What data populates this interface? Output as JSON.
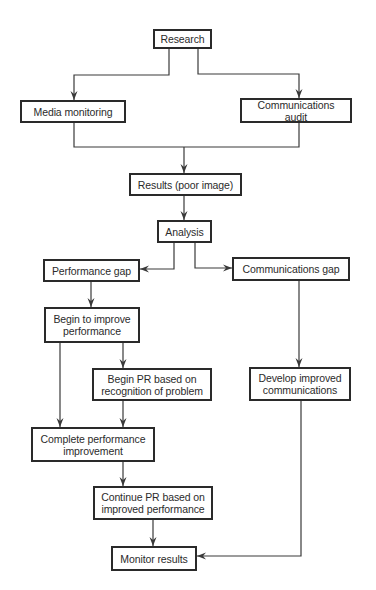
{
  "diagram": {
    "type": "flowchart",
    "line_color": "#3a3a3a",
    "nodes": [
      {
        "id": "research",
        "label": "Research",
        "x": 153,
        "y": 29,
        "w": 59,
        "h": 20
      },
      {
        "id": "media-monitoring",
        "label": "Media monitoring",
        "x": 20,
        "y": 100,
        "w": 106,
        "h": 23
      },
      {
        "id": "communications-audit",
        "label": "Communications audit",
        "x": 240,
        "y": 98,
        "w": 112,
        "h": 25
      },
      {
        "id": "results",
        "label": "Results (poor image)",
        "x": 129,
        "y": 173,
        "w": 113,
        "h": 23
      },
      {
        "id": "analysis",
        "label": "Analysis",
        "x": 157,
        "y": 220,
        "w": 55,
        "h": 23
      },
      {
        "id": "performance-gap",
        "label": "Performance gap",
        "x": 43,
        "y": 259,
        "w": 97,
        "h": 23
      },
      {
        "id": "communications-gap",
        "label": "Communications gap",
        "x": 232,
        "y": 257,
        "w": 118,
        "h": 24
      },
      {
        "id": "begin-improve",
        "label": "Begin to improve performance",
        "x": 44,
        "y": 307,
        "w": 96,
        "h": 36
      },
      {
        "id": "begin-pr",
        "label": "Begin PR based on recognition of problem",
        "x": 92,
        "y": 368,
        "w": 120,
        "h": 33
      },
      {
        "id": "develop-comms",
        "label": "Develop improved communications",
        "x": 249,
        "y": 367,
        "w": 102,
        "h": 34
      },
      {
        "id": "complete-improvement",
        "label": "Complete performance improvement",
        "x": 31,
        "y": 427,
        "w": 124,
        "h": 35
      },
      {
        "id": "continue-pr",
        "label": "Continue PR based on improved performance",
        "x": 93,
        "y": 486,
        "w": 120,
        "h": 34
      },
      {
        "id": "monitor-results",
        "label": "Monitor results",
        "x": 111,
        "y": 546,
        "w": 86,
        "h": 25
      }
    ],
    "edges": [
      {
        "from": "research",
        "to": "media-monitoring",
        "points": [
          [
            169,
            49
          ],
          [
            169,
            75
          ],
          [
            74,
            75
          ],
          [
            74,
            100
          ]
        ],
        "arrow": true
      },
      {
        "from": "research",
        "to": "communications-audit",
        "points": [
          [
            198,
            49
          ],
          [
            198,
            74
          ],
          [
            299,
            74
          ],
          [
            299,
            98
          ]
        ],
        "arrow": true
      },
      {
        "from": "media-monitoring",
        "to": "merge",
        "points": [
          [
            74,
            123
          ],
          [
            74,
            147
          ],
          [
            299,
            147
          ],
          [
            299,
            123
          ]
        ],
        "arrow": false
      },
      {
        "from": "merge",
        "to": "results",
        "points": [
          [
            184,
            147
          ],
          [
            184,
            173
          ]
        ],
        "arrow": true
      },
      {
        "from": "results",
        "to": "analysis",
        "points": [
          [
            184,
            196
          ],
          [
            184,
            220
          ]
        ],
        "arrow": true
      },
      {
        "from": "analysis",
        "to": "performance-gap",
        "points": [
          [
            174,
            243
          ],
          [
            174,
            269
          ],
          [
            140,
            269
          ]
        ],
        "arrow": true
      },
      {
        "from": "analysis",
        "to": "communications-gap",
        "points": [
          [
            195,
            243
          ],
          [
            195,
            268
          ],
          [
            232,
            268
          ]
        ],
        "arrow": true
      },
      {
        "from": "performance-gap",
        "to": "begin-improve",
        "points": [
          [
            91,
            282
          ],
          [
            91,
            307
          ]
        ],
        "arrow": true
      },
      {
        "from": "begin-improve",
        "to": "begin-pr",
        "points": [
          [
            123,
            343
          ],
          [
            123,
            368
          ]
        ],
        "arrow": true
      },
      {
        "from": "begin-improve",
        "to": "complete-improvement",
        "points": [
          [
            60,
            343
          ],
          [
            60,
            427
          ]
        ],
        "arrow": true
      },
      {
        "from": "begin-pr",
        "to": "complete-improvement",
        "points": [
          [
            123,
            401
          ],
          [
            123,
            427
          ]
        ],
        "arrow": true
      },
      {
        "from": "communications-gap",
        "to": "develop-comms",
        "points": [
          [
            299,
            281
          ],
          [
            299,
            367
          ]
        ],
        "arrow": true
      },
      {
        "from": "complete-improvement",
        "to": "continue-pr",
        "points": [
          [
            123,
            462
          ],
          [
            123,
            486
          ]
        ],
        "arrow": true
      },
      {
        "from": "continue-pr",
        "to": "monitor-results",
        "points": [
          [
            153,
            520
          ],
          [
            153,
            546
          ]
        ],
        "arrow": true
      },
      {
        "from": "develop-comms",
        "to": "monitor-results",
        "points": [
          [
            301,
            401
          ],
          [
            301,
            556
          ],
          [
            197,
            556
          ]
        ],
        "arrow": true
      }
    ]
  }
}
